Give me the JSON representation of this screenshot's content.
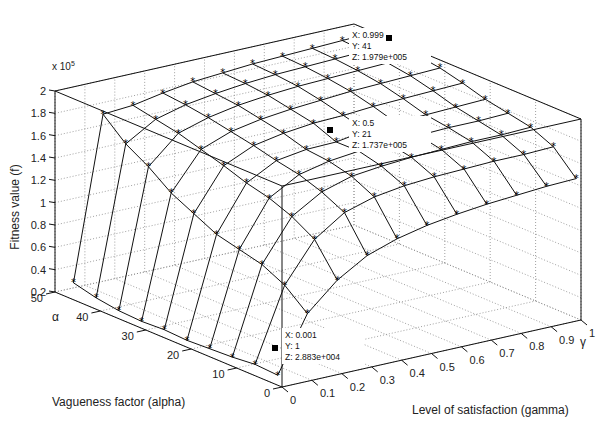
{
  "chart_data": {
    "type": "surface3d",
    "title": "",
    "xlabel": "Level of satisfaction (gamma)",
    "ylabel": "Vagueness factor (alpha)",
    "zlabel": "Fitness value (f)",
    "z_multiplier": "x 10",
    "z_exponent": "5",
    "x_axis_symbol": "γ",
    "y_axis_symbol": "α",
    "xlim": [
      0,
      1
    ],
    "ylim": [
      0,
      50
    ],
    "zlim": [
      0.2,
      2
    ],
    "x_ticks": [
      "0",
      "0.1",
      "0.2",
      "0.3",
      "0.4",
      "0.5",
      "0.6",
      "0.7",
      "0.8",
      "0.9",
      "1"
    ],
    "y_ticks": [
      "0",
      "10",
      "20",
      "30",
      "40",
      "50"
    ],
    "z_ticks": [
      "0.2",
      "0.4",
      "0.6",
      "0.8",
      "1",
      "1.2",
      "1.4",
      "1.6",
      "1.8",
      "2"
    ],
    "grid": true,
    "x": [
      0.001,
      0.1,
      0.2,
      0.3,
      0.4,
      0.5,
      0.6,
      0.7,
      0.8,
      0.9,
      0.999
    ],
    "y": [
      1,
      6,
      11,
      16,
      21,
      26,
      31,
      36,
      41,
      46
    ],
    "z": [
      [
        0.288,
        0.78,
        1.02,
        1.18,
        1.27,
        1.33,
        1.37,
        1.4,
        1.42,
        1.44,
        1.45
      ],
      [
        0.3,
        0.95,
        1.3,
        1.48,
        1.56,
        1.6,
        1.62,
        1.63,
        1.64,
        1.64,
        1.65
      ],
      [
        0.28,
        1.05,
        1.42,
        1.58,
        1.66,
        1.69,
        1.71,
        1.72,
        1.73,
        1.73,
        1.74
      ],
      [
        0.27,
        1.1,
        1.5,
        1.65,
        1.71,
        1.74,
        1.75,
        1.76,
        1.77,
        1.77,
        1.78
      ],
      [
        0.26,
        1.15,
        1.55,
        1.69,
        1.73,
        1.737,
        1.78,
        1.79,
        1.8,
        1.81,
        1.82
      ],
      [
        0.27,
        1.25,
        1.62,
        1.74,
        1.79,
        1.82,
        1.83,
        1.85,
        1.86,
        1.87,
        1.88
      ],
      [
        0.26,
        1.35,
        1.68,
        1.78,
        1.83,
        1.86,
        1.88,
        1.9,
        1.91,
        1.92,
        1.93
      ],
      [
        0.27,
        1.5,
        1.74,
        1.82,
        1.87,
        1.9,
        1.92,
        1.93,
        1.94,
        1.95,
        1.96
      ],
      [
        0.3,
        1.62,
        1.78,
        1.85,
        1.89,
        1.92,
        1.94,
        1.95,
        1.96,
        1.97,
        1.979
      ],
      [
        0.35,
        1.8,
        1.82,
        1.87,
        1.91,
        1.93,
        1.95,
        1.96,
        1.97,
        1.98,
        1.99
      ]
    ],
    "marker": "asterisk",
    "annotations": [
      {
        "x_label": "X: 0.999",
        "y_label": "Y: 41",
        "z_label": "Z: 1.979e+005"
      },
      {
        "x_label": "X: 0.5",
        "y_label": "Y: 21",
        "z_label": "Z: 1.737e+005"
      },
      {
        "x_label": "X: 0.001",
        "y_label": "Y: 1",
        "z_label": "Z: 2.883e+004"
      }
    ]
  },
  "labels": {
    "zlabel": "Fitness value (f)",
    "ylabel": "Vagueness factor (alpha)",
    "xlabel": "Level of satisfaction (gamma)",
    "alpha_symbol": "α",
    "gamma_symbol": "γ",
    "mult": "x 10",
    "exp": "5"
  },
  "colors": {
    "line": "#111111",
    "grid": "#888888",
    "background": "#ffffff"
  }
}
